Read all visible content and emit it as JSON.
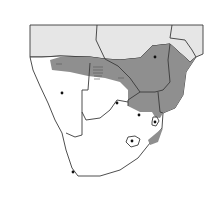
{
  "map": {
    "title": "",
    "region": "Southern Africa",
    "colors": {
      "background": "#ffffff",
      "land": "#ffffff",
      "outside_region": "#e6e6e6",
      "range": "#8f8f8f",
      "border": "#3a3a3a",
      "point": "#111111"
    },
    "legend": [],
    "range_description": "Shaded distribution range across northern Namibia, northern Botswana, Zimbabwe, Mozambique, northeastern South Africa",
    "points": [
      {
        "name": "point-namibia",
        "x": 62,
        "y": 93
      },
      {
        "name": "point-botswana",
        "x": 117,
        "y": 103
      },
      {
        "name": "point-zimbabwe",
        "x": 155,
        "y": 57
      },
      {
        "name": "point-gauteng",
        "x": 139,
        "y": 115
      },
      {
        "name": "point-swaziland",
        "x": 155,
        "y": 122
      },
      {
        "name": "point-lesotho",
        "x": 132,
        "y": 141
      },
      {
        "name": "point-cape",
        "x": 73,
        "y": 172
      }
    ]
  }
}
